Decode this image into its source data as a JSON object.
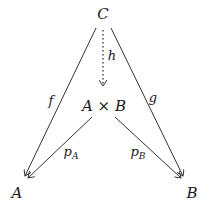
{
  "diagram": {
    "type": "commutative-diagram",
    "nodes": {
      "C": {
        "label": "C",
        "x": 103,
        "y": 14
      },
      "AxB": {
        "label": "A × B",
        "x": 104,
        "y": 106
      },
      "A": {
        "label": "A",
        "x": 17,
        "y": 193
      },
      "B": {
        "label": "B",
        "x": 192,
        "y": 193
      }
    },
    "edges": {
      "f": {
        "label": "f",
        "from": "C",
        "to": "A",
        "style": "solid"
      },
      "g": {
        "label": "g",
        "from": "C",
        "to": "B",
        "style": "solid"
      },
      "h": {
        "label": "h",
        "from": "C",
        "to": "A × B",
        "style": "dotted"
      },
      "pA": {
        "label": "p",
        "sub": "A",
        "from": "A × B",
        "to": "A",
        "style": "solid"
      },
      "pB": {
        "label": "p",
        "sub": "B",
        "from": "A × B",
        "to": "B",
        "style": "solid"
      }
    },
    "colors": {
      "stroke": "#333333",
      "text": "#1a1a1a",
      "background": "#ffffff"
    }
  }
}
